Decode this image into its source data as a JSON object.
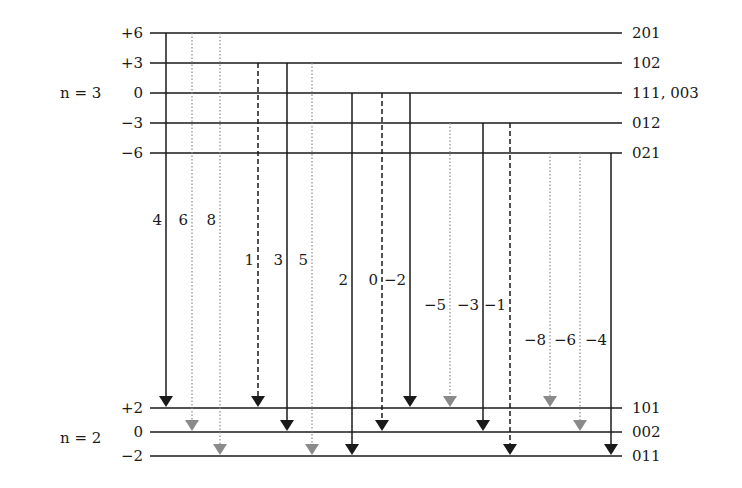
{
  "colors": {
    "line": "#1a1a1a",
    "allowed": "#1a1a1a",
    "forbidden": "#8a8a8a"
  },
  "upper_group": {
    "n_label": "n = 3",
    "levels": [
      {
        "value": "+6",
        "states": "201"
      },
      {
        "value": "+3",
        "states": "102"
      },
      {
        "value": "0",
        "states": "111, 003"
      },
      {
        "value": "−3",
        "states": "012"
      },
      {
        "value": "−6",
        "states": "021"
      }
    ]
  },
  "lower_group": {
    "n_label": "n = 2",
    "levels": [
      {
        "value": "+2",
        "states": "101"
      },
      {
        "value": "0",
        "states": "002"
      },
      {
        "value": "−2",
        "states": "011"
      }
    ]
  },
  "transitions": [
    {
      "label": "4",
      "from": 0,
      "to": 0,
      "style": "solid"
    },
    {
      "label": "6",
      "from": 0,
      "to": 1,
      "style": "dotted"
    },
    {
      "label": "8",
      "from": 0,
      "to": 2,
      "style": "dotted"
    },
    {
      "label": "1",
      "from": 1,
      "to": 0,
      "style": "dashed"
    },
    {
      "label": "3",
      "from": 1,
      "to": 1,
      "style": "solid"
    },
    {
      "label": "5",
      "from": 1,
      "to": 2,
      "style": "dotted"
    },
    {
      "label": "2",
      "from": 2,
      "to": 2,
      "style": "solid"
    },
    {
      "label": "0",
      "from": 2,
      "to": 1,
      "style": "dashed"
    },
    {
      "label": "−2",
      "from": 2,
      "to": 0,
      "style": "solid"
    },
    {
      "label": "−5",
      "from": 3,
      "to": 0,
      "style": "dotted"
    },
    {
      "label": "−3",
      "from": 3,
      "to": 1,
      "style": "solid"
    },
    {
      "label": "−1",
      "from": 3,
      "to": 2,
      "style": "dashed"
    },
    {
      "label": "−8",
      "from": 4,
      "to": 0,
      "style": "dotted"
    },
    {
      "label": "−6",
      "from": 4,
      "to": 1,
      "style": "dotted"
    },
    {
      "label": "−4",
      "from": 4,
      "to": 2,
      "style": "solid"
    }
  ]
}
